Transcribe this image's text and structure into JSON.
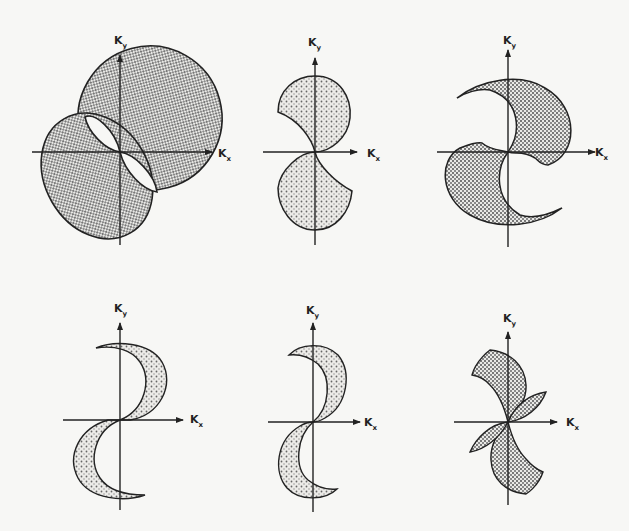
{
  "figure": {
    "axis_labels": {
      "x_main": "K",
      "x_sub": "x",
      "y_main": "K",
      "y_sub": "y"
    },
    "colors": {
      "ink": "#222222",
      "background": "#f7f7f5",
      "hatch": "#555555"
    },
    "panels": [
      {
        "id": 1,
        "name": "panel-1",
        "pattern": "crosshatch",
        "shape": "overlapping ellipses with clear lens cutouts"
      },
      {
        "id": 2,
        "name": "panel-2",
        "pattern": "dots",
        "shape": "two pac-man lobes"
      },
      {
        "id": 3,
        "name": "panel-3",
        "pattern": "crosshatch",
        "shape": "two large crescents (yin-yang)"
      },
      {
        "id": 4,
        "name": "panel-4",
        "pattern": "dots",
        "shape": "two thin crescents"
      },
      {
        "id": 5,
        "name": "panel-5",
        "pattern": "dots",
        "shape": "two crescents"
      },
      {
        "id": 6,
        "name": "panel-6",
        "pattern": "crosshatch",
        "shape": "two crescents with small petal lobes"
      }
    ]
  }
}
